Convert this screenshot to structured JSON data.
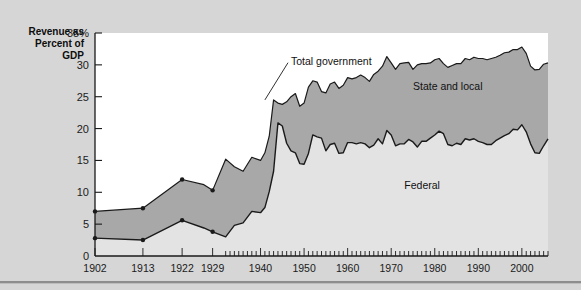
{
  "axis_title": "Revenue as\nPercent of\nGDP",
  "colors": {
    "page_background": "#d6d6d6",
    "plot_background": "#ffffff",
    "federal_fill": "#e3e3e3",
    "state_local_fill": "#a8a8a8",
    "line": "#1a1a1a",
    "axis": "#1a1a1a",
    "text": "#111111"
  },
  "labels": {
    "total_government": "Total government",
    "state_and_local": "State and local",
    "federal": "Federal"
  },
  "chart_data": {
    "type": "area",
    "title": "Revenue as Percent of GDP",
    "xlabel": "",
    "ylabel": "Revenue as Percent of GDP",
    "ylim": [
      0,
      35
    ],
    "xlim": [
      1902,
      2006
    ],
    "grid": false,
    "legend_position": "inline-annotations",
    "ytick_labels": [
      "0",
      "5",
      "10",
      "15",
      "20",
      "25",
      "30",
      "35%"
    ],
    "ytick_values": [
      0,
      5,
      10,
      15,
      20,
      25,
      30,
      35
    ],
    "xtick_labels": [
      "1902",
      "1913",
      "1922",
      "1929",
      "1940",
      "1950",
      "1960",
      "1970",
      "1980",
      "1990",
      "2000"
    ],
    "xtick_values": [
      1902,
      1913,
      1922,
      1929,
      1940,
      1950,
      1960,
      1970,
      1980,
      1990,
      2000
    ],
    "minor_xticks_start": 1932,
    "minor_xticks_interval": 1,
    "annotations": [
      {
        "text": "Total government",
        "x": 1947,
        "y": 30.5,
        "leader_to_x": 1941,
        "leader_to_y": 24.5
      },
      {
        "text": "State and local",
        "x": 1975,
        "y": 26.0
      },
      {
        "text": "Federal",
        "x": 1973,
        "y": 10.5
      }
    ],
    "series": [
      {
        "name": "Total government",
        "stacking": "top-of-stack",
        "x": [
          1902,
          1913,
          1922,
          1927,
          1929,
          1932,
          1934,
          1936,
          1938,
          1940,
          1941,
          1942,
          1943,
          1944,
          1945,
          1946,
          1947,
          1948,
          1949,
          1950,
          1951,
          1952,
          1953,
          1954,
          1955,
          1956,
          1957,
          1958,
          1959,
          1960,
          1961,
          1962,
          1963,
          1964,
          1965,
          1966,
          1967,
          1968,
          1969,
          1970,
          1971,
          1972,
          1973,
          1974,
          1975,
          1976,
          1977,
          1978,
          1979,
          1980,
          1981,
          1982,
          1983,
          1984,
          1985,
          1986,
          1987,
          1988,
          1989,
          1990,
          1991,
          1992,
          1993,
          1994,
          1995,
          1996,
          1997,
          1998,
          1999,
          2000,
          2001,
          2002,
          2003,
          2004,
          2005,
          2006
        ],
        "values": [
          7.0,
          7.5,
          12.0,
          11.2,
          10.3,
          15.2,
          14.0,
          13.3,
          15.5,
          15.0,
          16.2,
          18.8,
          24.5,
          24.0,
          23.8,
          24.2,
          25.0,
          25.5,
          23.5,
          24.0,
          26.5,
          27.5,
          27.3,
          25.8,
          25.6,
          27.0,
          27.3,
          26.3,
          26.8,
          28.0,
          27.8,
          28.0,
          28.4,
          28.0,
          27.4,
          28.5,
          29.0,
          29.8,
          31.3,
          30.3,
          29.3,
          30.2,
          30.3,
          30.4,
          29.3,
          30.0,
          30.2,
          30.2,
          30.3,
          30.8,
          31.0,
          30.2,
          29.6,
          29.9,
          30.2,
          30.2,
          31.0,
          30.8,
          31.2,
          31.0,
          31.0,
          30.8,
          31.0,
          31.2,
          31.5,
          31.9,
          32.0,
          32.4,
          32.4,
          32.8,
          31.8,
          29.8,
          29.2,
          29.3,
          30.1,
          30.3
        ]
      },
      {
        "name": "Federal",
        "stacking": "bottom-of-stack",
        "x": [
          1902,
          1913,
          1922,
          1927,
          1929,
          1932,
          1934,
          1936,
          1938,
          1940,
          1941,
          1942,
          1943,
          1944,
          1945,
          1946,
          1947,
          1948,
          1949,
          1950,
          1951,
          1952,
          1953,
          1954,
          1955,
          1956,
          1957,
          1958,
          1959,
          1960,
          1961,
          1962,
          1963,
          1964,
          1965,
          1966,
          1967,
          1968,
          1969,
          1970,
          1971,
          1972,
          1973,
          1974,
          1975,
          1976,
          1977,
          1978,
          1979,
          1980,
          1981,
          1982,
          1983,
          1984,
          1985,
          1986,
          1987,
          1988,
          1989,
          1990,
          1991,
          1992,
          1993,
          1994,
          1995,
          1996,
          1997,
          1998,
          1999,
          2000,
          2001,
          2002,
          2003,
          2004,
          2005,
          2006
        ],
        "values": [
          2.8,
          2.5,
          5.6,
          4.4,
          3.8,
          3.0,
          4.8,
          5.2,
          7.0,
          6.8,
          7.6,
          10.1,
          13.3,
          20.9,
          20.4,
          17.7,
          16.5,
          16.2,
          14.5,
          14.4,
          16.1,
          19.0,
          18.7,
          18.5,
          16.5,
          17.5,
          17.7,
          16.1,
          16.2,
          17.8,
          17.8,
          17.6,
          17.8,
          17.6,
          17.0,
          17.4,
          18.4,
          17.6,
          19.7,
          19.0,
          17.3,
          17.6,
          17.6,
          18.3,
          17.9,
          17.1,
          18.0,
          18.0,
          18.5,
          19.0,
          19.6,
          19.2,
          17.5,
          17.3,
          17.7,
          17.5,
          18.4,
          18.2,
          18.4,
          18.0,
          17.8,
          17.5,
          17.5,
          18.1,
          18.5,
          18.9,
          19.2,
          19.9,
          19.8,
          20.6,
          19.5,
          17.6,
          16.2,
          16.1,
          17.3,
          18.4
        ]
      },
      {
        "name": "State and local",
        "stacking": "band-between",
        "note": "Band between Federal line and Total government line"
      }
    ],
    "early_markers_x": [
      1902,
      1913,
      1922,
      1929
    ],
    "early_markers_total": [
      7.0,
      7.5,
      12.0,
      10.3
    ],
    "early_markers_federal": [
      2.8,
      2.5,
      5.6,
      3.8
    ]
  }
}
